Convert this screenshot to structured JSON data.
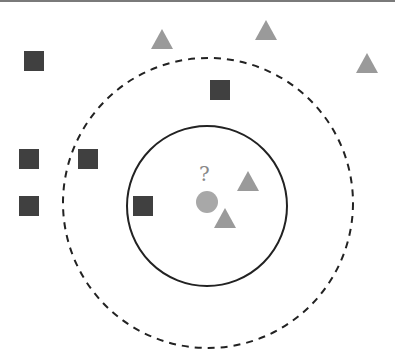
{
  "diagram": {
    "query_label": "?",
    "colors": {
      "square": "#404040",
      "triangle": "#9a9a9a",
      "query": "#a8a8a8",
      "circle_stroke": "#222222",
      "border": "#7a7a7a"
    },
    "squares": [
      {
        "x": 34,
        "y": 61
      },
      {
        "x": 220,
        "y": 90
      },
      {
        "x": 29,
        "y": 159
      },
      {
        "x": 88,
        "y": 159
      },
      {
        "x": 29,
        "y": 206
      },
      {
        "x": 143,
        "y": 206
      }
    ],
    "triangles": [
      {
        "x": 162,
        "y": 39
      },
      {
        "x": 266,
        "y": 30
      },
      {
        "x": 367,
        "y": 63
      },
      {
        "x": 248,
        "y": 181
      },
      {
        "x": 225,
        "y": 218
      }
    ],
    "query_point": {
      "x": 207,
      "y": 202
    },
    "inner_circle": {
      "cx": 207,
      "cy": 206,
      "r": 80,
      "style": "solid",
      "label": "k=3"
    },
    "outer_circle": {
      "cx": 208,
      "cy": 203,
      "r": 145,
      "style": "dashed",
      "label": "k=5"
    }
  }
}
